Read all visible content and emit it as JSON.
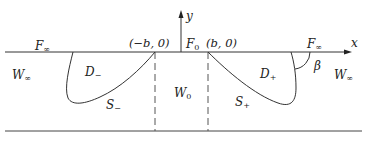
{
  "figure": {
    "axes": {
      "x_label": "x",
      "y_label": "y"
    },
    "points": {
      "left": "(−b, 0)",
      "right": "(b, 0)"
    },
    "boundary_labels": {
      "F_inf_left": {
        "base": "F",
        "sub": "∞"
      },
      "F_zero": {
        "base": "F",
        "sub": "0"
      },
      "F_inf_right": {
        "base": "F",
        "sub": "∞"
      }
    },
    "region_labels": {
      "W_inf_left": {
        "base": "W",
        "sub": "∞"
      },
      "D_minus": {
        "base": "D",
        "sub": "−"
      },
      "S_minus": {
        "base": "S",
        "sub": "−"
      },
      "W_zero": {
        "base": "W",
        "sub": "0"
      },
      "S_plus": {
        "base": "S",
        "sub": "+"
      },
      "D_plus": {
        "base": "D",
        "sub": "+"
      },
      "W_inf_right": {
        "base": "W",
        "sub": "∞"
      }
    },
    "angle_label": "β",
    "colors": {
      "line": "#333333",
      "dashed": "#555555",
      "text": "#222222"
    }
  }
}
